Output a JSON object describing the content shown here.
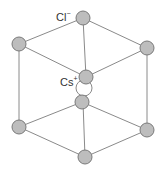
{
  "labels": {
    "anion": "Cl",
    "anion_charge": "−",
    "cation": "Cs",
    "cation_charge": "+"
  },
  "colors": {
    "atom_fill": "#bdbdbd",
    "atom_stroke": "#7a7a7a",
    "edge": "#8a8a8a",
    "cation_fill": "#ffffff"
  },
  "atoms": {
    "top": [
      83,
      18
    ],
    "upper_left": [
      19,
      44
    ],
    "upper_right": [
      147,
      48
    ],
    "upper_center": [
      86,
      77
    ],
    "lower_center": [
      82,
      102
    ],
    "lower_left": [
      19,
      127
    ],
    "lower_right": [
      147,
      130
    ],
    "bottom": [
      85,
      157
    ]
  },
  "cation_position": [
    85,
    87
  ]
}
